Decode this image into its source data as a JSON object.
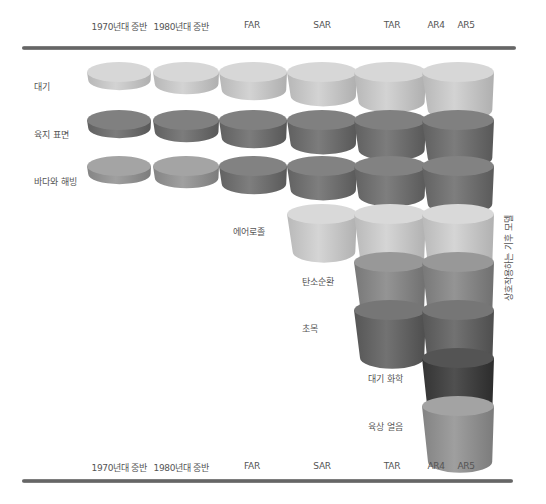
{
  "diagram": {
    "columns": [
      "1970년대 중반",
      "1980년대 중반",
      "FAR",
      "SAR",
      "TAR",
      "AR4",
      "AR5"
    ],
    "side_label": "상호작용하는 기후 모델",
    "rows": [
      {
        "label": "대기",
        "color": "#cdcdcd",
        "start_col": 0
      },
      {
        "label": "육지 표면",
        "color": "#767676",
        "start_col": 0
      },
      {
        "label": "바다와 해빙",
        "color": "#8c8c8c",
        "start_col": 0
      },
      {
        "label": "에어로졸",
        "color": "#cfcfcf",
        "start_col": 3
      },
      {
        "label": "탄소순환",
        "color": "#8e8e8e",
        "start_col": 4
      },
      {
        "label": "초목",
        "color": "#6c6c6c",
        "start_col": 4
      },
      {
        "label": "대기 화학",
        "color": "#4a4a4a",
        "start_col": 5
      },
      {
        "label": "육상 얼음",
        "color": "#999999",
        "start_col": 5
      }
    ]
  }
}
